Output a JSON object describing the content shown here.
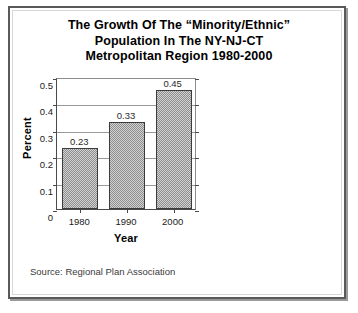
{
  "panel": {
    "title_lines": [
      "The Growth Of The “Minority/Ethnic”",
      "Population In The NY-NJ-CT",
      "Metropolitan Region 1980-2000"
    ],
    "source_note": "Source: Regional Plan Association",
    "border_color": "#5a5a5a",
    "background_color": "#ffffff"
  },
  "chart_data": {
    "type": "bar",
    "title": "The Growth Of The “Minority/Ethnic” Population In The NY-NJ-CT Metropolitan Region 1980-2000",
    "categories": [
      "1980",
      "1990",
      "2000"
    ],
    "values": [
      0.23,
      0.33,
      0.45
    ],
    "data_labels": [
      "0.23",
      "0.33",
      "0.45"
    ],
    "xlabel": "Year",
    "ylabel": "Percent",
    "ylim": [
      0,
      0.5
    ],
    "ytick_labels": [
      "0.5",
      "0.4",
      "0.3",
      "0.2",
      "0.1",
      "0"
    ],
    "ytick_values": [
      0.5,
      0.4,
      0.3,
      0.2,
      0.1,
      0
    ],
    "grid": true,
    "legend": "none",
    "bar_fill_color": "#b4b4b4",
    "bar_edge_color": "#3c3c3c",
    "gridline_color": "#9a9a9a",
    "axis_color": "#4a4a4a"
  }
}
